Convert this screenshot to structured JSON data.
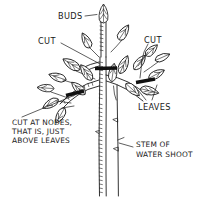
{
  "diagram": {
    "background_color": "#ffffff",
    "ink_color": "#1c1c1c",
    "cut_mark_color": "#111111",
    "labels": {
      "buds": "BUDS",
      "cut_left": "CUT",
      "cut_right": "CUT",
      "leaves": "LEAVES",
      "cut_at_nodes_line1": "CUT AT NODES,",
      "cut_at_nodes_line2": "THAT IS, JUST",
      "cut_at_nodes_line3": "ABOVE LEAVES",
      "stem_line1": "STEM OF",
      "stem_line2": "WATER SHOOT"
    },
    "parts": [
      {
        "name": "bud",
        "label": "BUDS",
        "count": 4
      },
      {
        "name": "leaf",
        "label": "LEAVES",
        "count": 14
      },
      {
        "name": "cut-mark",
        "label": "CUT",
        "count": 3
      },
      {
        "name": "main-stem",
        "label": "STEM OF WATER SHOOT",
        "count": 1
      },
      {
        "name": "secondary-stem",
        "label": "STEM OF WATER SHOOT",
        "count": 1
      }
    ]
  }
}
